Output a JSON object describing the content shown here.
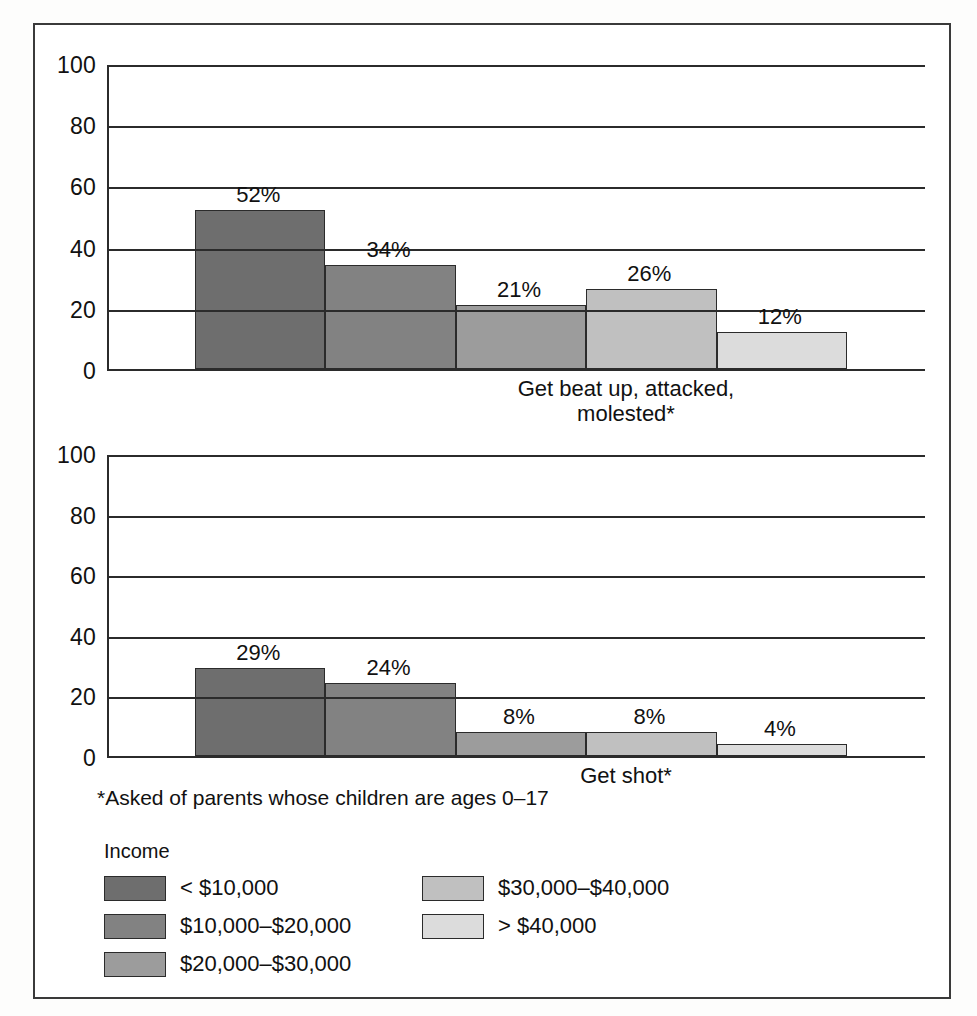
{
  "figure": {
    "footnote": "*Asked of parents whose children are ages 0–17"
  },
  "legend": {
    "title": "Income",
    "items": [
      {
        "label": "< $10,000",
        "color": "#6e6e6e"
      },
      {
        "label": "$10,000–$20,000",
        "color": "#828282"
      },
      {
        "label": "$20,000–$30,000",
        "color": "#9c9c9c"
      },
      {
        "label": "$30,000–$40,000",
        "color": "#c0c0c0"
      },
      {
        "label": "> $40,000",
        "color": "#dcdcdc"
      }
    ]
  },
  "chart_data": [
    {
      "type": "bar",
      "title": "",
      "xlabel": "Get beat up, attacked,\nmolested*",
      "ylabel": "",
      "ylim": [
        0,
        100
      ],
      "yticks": [
        0,
        20,
        40,
        60,
        80,
        100
      ],
      "ytick_labels": [
        "0",
        "20",
        "40",
        "60",
        "80",
        "100"
      ],
      "grid": true,
      "legend_position": "below-figure",
      "categories": [
        "< $10,000",
        "$10,000–$20,000",
        "$20,000–$30,000",
        "$30,000–$40,000",
        "> $40,000"
      ],
      "values": [
        52,
        34,
        21,
        26,
        12
      ],
      "value_labels": [
        "52%",
        "34%",
        "21%",
        "26%",
        "12%"
      ],
      "colors": [
        "#6e6e6e",
        "#828282",
        "#9c9c9c",
        "#c0c0c0",
        "#dcdcdc"
      ]
    },
    {
      "type": "bar",
      "title": "",
      "xlabel": "Get shot*",
      "ylabel": "",
      "ylim": [
        0,
        100
      ],
      "yticks": [
        0,
        20,
        40,
        60,
        80,
        100
      ],
      "ytick_labels": [
        "0",
        "20",
        "40",
        "60",
        "80",
        "100"
      ],
      "grid": true,
      "legend_position": "below-figure",
      "categories": [
        "< $10,000",
        "$10,000–$20,000",
        "$20,000–$30,000",
        "$30,000–$40,000",
        "> $40,000"
      ],
      "values": [
        29,
        24,
        8,
        8,
        4
      ],
      "value_labels": [
        "29%",
        "24%",
        "8%",
        "8%",
        "4%"
      ],
      "colors": [
        "#6e6e6e",
        "#828282",
        "#9c9c9c",
        "#c0c0c0",
        "#dcdcdc"
      ]
    }
  ]
}
